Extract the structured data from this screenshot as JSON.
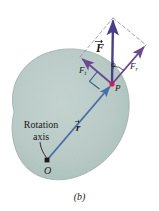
{
  "figure": {
    "caption": "(b)",
    "background_color": "#ffffff",
    "body_fill_color": "#b9cac6",
    "body_edge_color": "#93a8a4",
    "force_vector_color": "#4a3f8c",
    "component_vector_color": "#6b4a8f",
    "radius_vector_color": "#4a6fa8",
    "dashed_line_color": "#8c86a8",
    "point_p_color": "#d4195a",
    "point_o_color": "#1a1a1a",
    "label_text_color": "#1a1a1a"
  },
  "labels": {
    "force_vector": "F",
    "tangential_component": "F",
    "tangential_subscript": "t",
    "radial_component": "F",
    "radial_subscript": "r",
    "angle": "ϕ",
    "point_p": "P",
    "point_o": "O",
    "radius_vector": "r",
    "rotation_axis_line1": "Rotation",
    "rotation_axis_line2": "axis"
  },
  "geometry": {
    "point_O": {
      "x": 47,
      "y": 160
    },
    "point_P": {
      "x": 112,
      "y": 84
    },
    "force_tip": {
      "x": 113,
      "y": 18
    },
    "tangential_tip": {
      "x": 80,
      "y": 57
    },
    "radial_tip": {
      "x": 146,
      "y": 45
    },
    "parallelogram_corner_top_left": {
      "x": 80,
      "y": 57
    },
    "parallelogram_corner_top_right": {
      "x": 146,
      "y": 45
    },
    "right_angle_marker": {
      "x": 98,
      "y": 78
    },
    "rotation_axis_leader_end": {
      "x": 47,
      "y": 158
    }
  },
  "elements": {
    "body_name": "rigid-body-blob",
    "force_arrow_name": "force-vector-arrow",
    "tangential_arrow_name": "tangential-component-arrow",
    "radial_arrow_name": "radial-component-arrow",
    "radius_arrow_name": "position-vector-arrow",
    "angle_arc_name": "angle-phi-arc"
  }
}
